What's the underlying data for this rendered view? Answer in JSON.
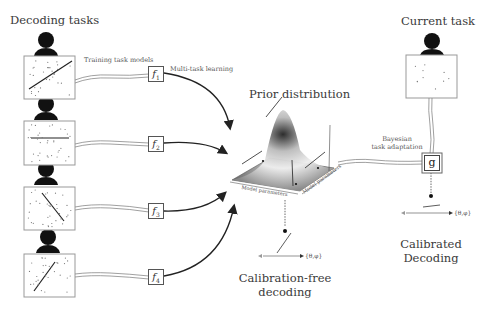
{
  "figure": {
    "left_title": "Decoding tasks",
    "right_title": "Current task",
    "center_title": "Prior distribution",
    "training_label": "Training task models",
    "multitask_label": "Multi-task learning",
    "bayesian_label_line1": "Bayesian",
    "bayesian_label_line2": "task adaptation",
    "surface_axis_x": "Model parameters",
    "surface_axis_y": "Model parameters",
    "task_models": [
      {
        "symbol": "f",
        "index": "1"
      },
      {
        "symbol": "f",
        "index": "2"
      },
      {
        "symbol": "f",
        "index": "3"
      },
      {
        "symbol": "f",
        "index": "4"
      }
    ],
    "adaptation_model": "g",
    "calib_free_set": "{θ,φ}",
    "calibrated_set": "{θ,φ}",
    "calib_free_line1": "Calibration-free",
    "calib_free_line2": "decoding",
    "calibrated_line1": "Calibrated",
    "calibrated_line2": "Decoding"
  }
}
